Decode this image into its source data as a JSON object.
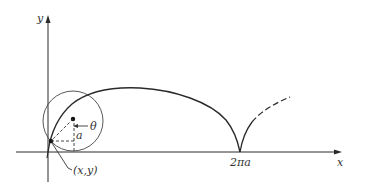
{
  "diagram": {
    "axes": {
      "x_label": "x",
      "y_label": "y"
    },
    "labels": {
      "theta": "θ",
      "radius": "a",
      "point": "(x,y)",
      "cusp": "2πa"
    },
    "colors": {
      "stroke": "#2a2a2a",
      "background": "#ffffff"
    }
  }
}
